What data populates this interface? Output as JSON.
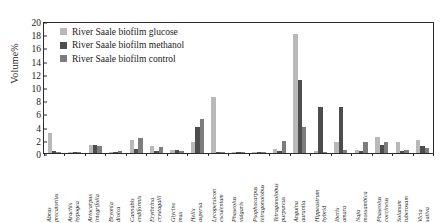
{
  "chart_data": {
    "type": "bar",
    "title": "",
    "xlabel": "",
    "ylabel": "Volume%",
    "ylim": [
      0,
      20
    ],
    "yticks": [
      0,
      2,
      4,
      6,
      8,
      10,
      12,
      14,
      16,
      18,
      20
    ],
    "grid": false,
    "legend_position": "top-left",
    "categories": [
      "Abrus precatorius",
      "Arachis hypogea",
      "Artocarpus integrifolia",
      "Bryonia dioica",
      "Cannabis endiformis",
      "Erythrina crystagalli",
      "Glycine max",
      "Helix aspersa",
      "Lycopersicon esculentum",
      "Phaseolus vulgaris",
      "Psophocarpus tetragonolobus",
      "Tetragonolobus purpureus",
      "Anguina aurantia",
      "Hippeastrum hybrid",
      "Iberis amara",
      "Naja mossambica",
      "Phaseolus coccineus",
      "Solanum tuberosum",
      "Vicia sativa"
    ],
    "series": [
      {
        "name": "River Saale biofilm glucose",
        "color": "#b9b9b9",
        "values": [
          3.0,
          0.2,
          1.2,
          0.1,
          2.0,
          1.0,
          0.5,
          1.6,
          8.5,
          0.1,
          0.2,
          0.6,
          18.0,
          0.3,
          1.6,
          0.5,
          2.5,
          1.6,
          1.9
        ]
      },
      {
        "name": "River Saale biofilm methanol",
        "color": "#4d4d4d",
        "values": [
          0.3,
          0.2,
          1.2,
          0.2,
          0.6,
          0.3,
          0.4,
          4.0,
          0.2,
          0.1,
          0.2,
          0.3,
          11.0,
          7.0,
          7.0,
          0.3,
          1.2,
          0.3,
          1.0
        ]
      },
      {
        "name": "River Saale biofilm control",
        "color": "#7d7d7d",
        "values": [
          0.2,
          0.2,
          1.1,
          0.3,
          2.2,
          0.9,
          0.3,
          5.2,
          0.2,
          0.1,
          0.2,
          1.8,
          4.0,
          0.2,
          0.4,
          1.7,
          1.7,
          0.5,
          0.8
        ]
      }
    ]
  }
}
